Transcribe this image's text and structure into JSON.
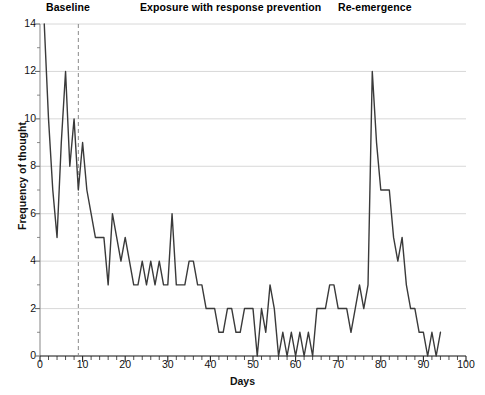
{
  "chart_data": {
    "type": "line",
    "title": "",
    "xlabel": "Days",
    "ylabel": "Frequency of thought",
    "xlim": [
      0,
      100
    ],
    "ylim": [
      0,
      14
    ],
    "xticks": [
      0,
      10,
      20,
      30,
      40,
      50,
      60,
      70,
      80,
      90,
      100
    ],
    "yticks": [
      0,
      2,
      4,
      6,
      8,
      10,
      12,
      14
    ],
    "x_minor_tick_step": 2,
    "grid": "horizontal",
    "legend": "none",
    "line_color": "#3a3a3a",
    "phase_line": {
      "x": 9,
      "style": "dashed",
      "color": "#8a8a8a"
    },
    "annotations": [
      {
        "text": "Baseline",
        "x": 4.5,
        "position": "top"
      },
      {
        "text": "Exposure with response prevention",
        "x": 33,
        "position": "top"
      },
      {
        "text": "Re-emergence",
        "x": 78,
        "position": "top"
      }
    ],
    "x": [
      1,
      2,
      3,
      4,
      5,
      6,
      7,
      8,
      9,
      10,
      11,
      12,
      13,
      14,
      15,
      16,
      17,
      18,
      19,
      20,
      21,
      22,
      23,
      24,
      25,
      26,
      27,
      28,
      29,
      30,
      31,
      32,
      33,
      34,
      35,
      36,
      37,
      38,
      39,
      40,
      41,
      42,
      43,
      44,
      45,
      46,
      47,
      48,
      49,
      50,
      51,
      52,
      53,
      54,
      55,
      56,
      57,
      58,
      59,
      60,
      61,
      62,
      63,
      64,
      65,
      66,
      67,
      68,
      69,
      70,
      71,
      72,
      73,
      74,
      75,
      76,
      77,
      78,
      79,
      80,
      81,
      82,
      83,
      84,
      85,
      86,
      87,
      88,
      89,
      90,
      91,
      92,
      93,
      94
    ],
    "values": [
      14,
      10,
      7,
      5,
      9,
      12,
      8,
      10,
      7,
      9,
      7,
      6,
      5,
      5,
      5,
      3,
      6,
      5,
      4,
      5,
      4,
      3,
      3,
      4,
      3,
      4,
      3,
      4,
      3,
      3,
      6,
      3,
      3,
      3,
      4,
      4,
      3,
      3,
      2,
      2,
      2,
      1,
      1,
      2,
      2,
      1,
      1,
      2,
      2,
      2,
      0,
      2,
      1,
      3,
      2,
      0,
      1,
      0,
      1,
      0,
      1,
      0,
      1,
      0,
      2,
      2,
      2,
      3,
      3,
      2,
      2,
      2,
      1,
      2,
      3,
      2,
      3,
      12,
      9,
      7,
      7,
      7,
      5,
      4,
      5,
      3,
      2,
      2,
      1,
      1,
      0,
      1,
      0,
      1
    ],
    "series_name": "Frequency of thought"
  },
  "axes": {
    "y_tick_labels": [
      "0",
      "2",
      "4",
      "6",
      "8",
      "10",
      "12",
      "14"
    ],
    "x_tick_labels": [
      "0",
      "10",
      "20",
      "30",
      "40",
      "50",
      "60",
      "70",
      "80",
      "90",
      "100"
    ],
    "x_axis_title": "Days",
    "y_axis_title": "Frequency of thought"
  },
  "phases": {
    "baseline": "Baseline",
    "exposure": "Exposure with response prevention",
    "reemergence": "Re-emergence"
  }
}
